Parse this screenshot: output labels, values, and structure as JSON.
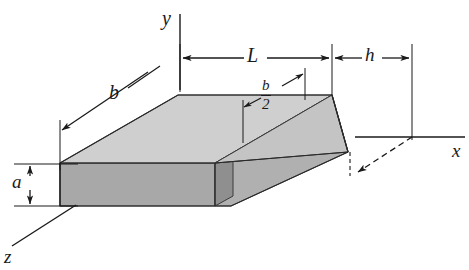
{
  "figure": {
    "type": "engineering-diagram",
    "background_color": "#ffffff",
    "line_color": "#1a1a1a",
    "canvas": {
      "width": 469,
      "height": 270
    }
  },
  "axes": {
    "y": {
      "label": "y",
      "orientation": "vertical",
      "from": {
        "x": 180,
        "y": 90
      },
      "to": {
        "x": 180,
        "y": 14
      }
    },
    "x": {
      "label": "x",
      "orientation": "horizontal",
      "from": {
        "x": 355,
        "y": 137
      },
      "to": {
        "x": 465,
        "y": 137
      }
    },
    "z": {
      "label": "z",
      "orientation": "diagonal-out-of-page",
      "from": {
        "x": 75,
        "y": 205
      },
      "to": {
        "x": 10,
        "y": 246
      }
    },
    "origin": {
      "x": 180,
      "y": 137
    }
  },
  "dimensions": [
    {
      "name": "b",
      "label": "b",
      "description": "width of beam at the fixed (built-in) end, measured along the slanted front-left top edge",
      "style": "diagonal-arrow",
      "label_position": {
        "x": 109,
        "y": 82
      }
    },
    {
      "name": "L",
      "label": "L",
      "description": "length of the tapered beam measured along the x axis",
      "style": "double-arrow-horizontal",
      "from_x": 180,
      "to_x": 332,
      "line_y": 58,
      "label_position": {
        "x": 247,
        "y": 45
      }
    },
    {
      "name": "h",
      "label": "h",
      "description": "distance from the free end of the beam to the reference vertical line",
      "style": "double-arrow-horizontal",
      "from_x": 332,
      "to_x": 412,
      "line_y": 58,
      "label_position": {
        "x": 365,
        "y": 45
      }
    },
    {
      "name": "a",
      "label": "a",
      "description": "depth (height) of the rectangular cross section",
      "style": "double-arrow-vertical",
      "line_x": 22,
      "from_y": 164,
      "to_y": 206,
      "label_position": {
        "x": 12,
        "y": 172
      }
    },
    {
      "name": "b_over_2",
      "numerator": "b",
      "denominator": "2",
      "label": "b/2",
      "description": "half width of the beam at the free end of the taper",
      "style": "two-leader-arrows",
      "label_position": {
        "x": 261,
        "y": 78
      }
    }
  ],
  "solid": {
    "description": "Rectangular prism (slab) that tapers in plan to a point, drawn in oblique projection",
    "faces": [
      {
        "name": "top-face",
        "shade": "#cfcfcf"
      },
      {
        "name": "front-face",
        "shade": "#a8a8a8"
      },
      {
        "name": "taper-top-face",
        "shade": "#c4c4c4"
      },
      {
        "name": "taper-side-face",
        "shade": "#9c9c9c"
      },
      {
        "name": "taper-under-face",
        "shade": "#b4b4b4"
      },
      {
        "name": "end-face",
        "shade": "#8f8f8f"
      }
    ]
  },
  "annotations": {
    "dashed_leader": {
      "description": "Dashed leader from the free-end tip of the beam down to the x axis reference",
      "style": "dashed-arrow"
    }
  }
}
